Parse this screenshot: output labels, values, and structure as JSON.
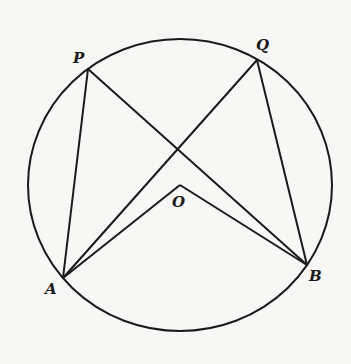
{
  "figure": {
    "type": "circle-geometry",
    "circle": {
      "cx": 180,
      "cy": 185,
      "rx": 152,
      "ry": 146
    },
    "colors": {
      "stroke": "#1a1a1a",
      "background": "#f7f7f5"
    },
    "points": {
      "P": {
        "label": "P",
        "x": 88,
        "y": 69
      },
      "Q": {
        "label": "Q",
        "x": 257,
        "y": 60
      },
      "A": {
        "label": "A",
        "x": 63,
        "y": 278
      },
      "B": {
        "label": "B",
        "x": 307,
        "y": 265
      },
      "O": {
        "label": "O",
        "x": 180,
        "y": 185
      }
    },
    "segments": [
      [
        "P",
        "A"
      ],
      [
        "P",
        "B"
      ],
      [
        "Q",
        "A"
      ],
      [
        "Q",
        "B"
      ],
      [
        "O",
        "A"
      ],
      [
        "O",
        "B"
      ]
    ],
    "labels": {
      "P": "P",
      "Q": "Q",
      "A": "A",
      "B": "B",
      "O": "O"
    }
  }
}
